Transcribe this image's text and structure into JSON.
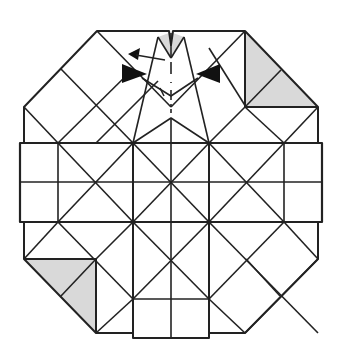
{
  "diagram": {
    "type": "origami-crease-pattern",
    "description": "Octagonal folded base with square grid, diagonal creases, shaded corner flaps, fold arrows and a dash-dot valley line at center top",
    "colors": {
      "line": "#222222",
      "shade": "#d9d9d9",
      "arrow": "#111111",
      "background": "#ffffff"
    },
    "shaded_regions": [
      {
        "name": "top-right-flap",
        "points": "245,31 318,107 245,107"
      },
      {
        "name": "bottom-left-flap",
        "points": "24,259 96,259 96,333"
      },
      {
        "name": "top-center-kite",
        "points": "158,37 171,31 184,37 171,58"
      }
    ],
    "arrows": [
      {
        "name": "left-push-arrow",
        "direction": "right"
      },
      {
        "name": "right-push-arrow",
        "direction": "left"
      },
      {
        "name": "fold-over-arrow",
        "direction": "left"
      }
    ]
  }
}
